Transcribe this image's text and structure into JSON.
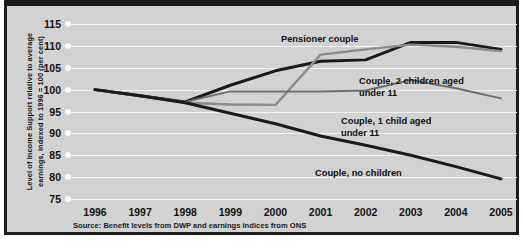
{
  "chart_data": {
    "type": "line",
    "title": "",
    "xlabel": "",
    "ylabel": "Level of Income Support relative to average earnings, indexed to 1996 = 100 (per cent)",
    "categories": [
      "1996",
      "1997",
      "1998",
      "1999",
      "2000",
      "2001",
      "2002",
      "2003",
      "2004",
      "2005"
    ],
    "ylim": [
      75,
      115
    ],
    "yticks": [
      75,
      80,
      85,
      90,
      95,
      100,
      105,
      110,
      115
    ],
    "grid": true,
    "legend_position": "inline-annotations",
    "series": [
      {
        "name": "Couple, 2 children aged under 11",
        "color": "#1a1a1a",
        "values": [
          100.0,
          98.6,
          97.2,
          101.0,
          104.3,
          106.5,
          106.8,
          110.8,
          110.8,
          109.2
        ]
      },
      {
        "name": "Pensioner couple",
        "color": "#8a8a8a",
        "values": [
          100.0,
          98.5,
          97.0,
          96.6,
          96.5,
          108.0,
          109.2,
          110.3,
          109.8,
          108.8
        ]
      },
      {
        "name": "Couple, 1 child aged under 11",
        "color": "#6e6e6e",
        "values": [
          100.0,
          98.6,
          97.2,
          99.6,
          99.6,
          99.6,
          99.8,
          102.2,
          100.3,
          98.0
        ]
      },
      {
        "name": "Couple, no children",
        "color": "#1a1a1a",
        "values": [
          100.0,
          98.6,
          97.0,
          94.6,
          92.2,
          89.4,
          87.3,
          85.0,
          82.4,
          79.6
        ]
      }
    ],
    "annotations": [
      {
        "text": "Pensioner couple",
        "series": "Pensioner couple"
      },
      {
        "text": "Couple, 2 children aged\nunder 11",
        "series": "Couple, 2 children aged under 11"
      },
      {
        "text": "Couple, 1 child aged\nunder 11",
        "series": "Couple, 1 child aged under 11"
      },
      {
        "text": "Couple, no children",
        "series": "Couple, no children"
      }
    ],
    "source": "Source: Benefit levels from DWP and earnings indices from ONS",
    "source_prefix": "Source:",
    "ylabel_line1": "Level of Income Support relative to average",
    "ylabel_line2": "earnings, indexed to 1996 = 100 (per cent)"
  }
}
